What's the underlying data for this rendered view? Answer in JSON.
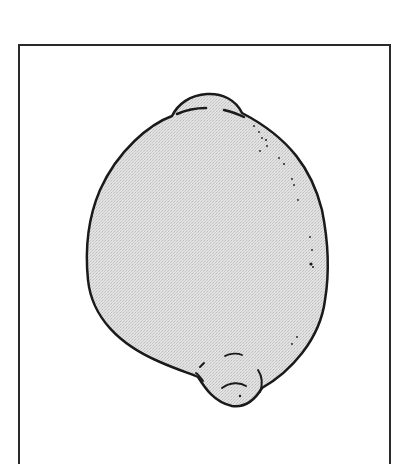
{
  "illustration": {
    "subject": "lemon",
    "style": "line drawing with light stippled gray fill",
    "colors": {
      "outline": "#1a1a1a",
      "fill": "#dcdcdc",
      "frame": "#2a2a2a",
      "background": "#ffffff"
    }
  }
}
